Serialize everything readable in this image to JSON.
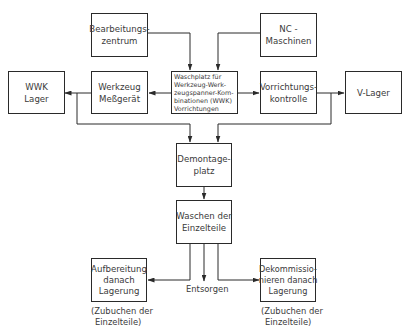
{
  "diagram": {
    "nodes": {
      "bearbeitungszentrum": {
        "lines": [
          "Bearbeitungs-",
          "zentrum"
        ]
      },
      "nc_maschinen": {
        "lines": [
          "NC  -",
          "Maschinen"
        ]
      },
      "wwk_lager": {
        "lines": [
          "WWK",
          "Lager"
        ]
      },
      "werkzeug_messgeraet": {
        "lines": [
          "Werkzeug",
          "Meßgerät"
        ]
      },
      "waschplatz": {
        "lines": [
          "Waschplatz  für",
          "Werkzeug-Werk-",
          "zeugspanner-Kom-",
          "binationen  (WWK)",
          "Vorrichtungen"
        ]
      },
      "vorrichtungskontrolle": {
        "lines": [
          "Vorrichtungs-",
          "kontrolle"
        ]
      },
      "v_lager": {
        "lines": [
          "V-Lager"
        ]
      },
      "demontageplatz": {
        "lines": [
          "Demontage-",
          "platz"
        ]
      },
      "waschen": {
        "lines": [
          "Waschen  der",
          "Einzelteile"
        ]
      },
      "aufbereitung": {
        "lines": [
          "Aufbereitung",
          "danach",
          "Lagerung"
        ]
      },
      "dekommissionieren": {
        "lines": [
          "Dekommissio-",
          "nieren  danach",
          "Lagerung"
        ]
      }
    },
    "labels": {
      "entsorgen": "Entsorgen",
      "note_left": [
        "(Zubuchen  der",
        "Einzelteile)"
      ],
      "note_right": [
        "(Zubuchen  der",
        "Einzelteile)"
      ]
    },
    "edges": [
      {
        "from": "Bearbeitungszentrum",
        "to": "Waschplatz"
      },
      {
        "from": "NC - Maschinen",
        "to": "Waschplatz"
      },
      {
        "from": "Waschplatz",
        "to": "Werkzeug Meßgerät"
      },
      {
        "from": "Werkzeug Meßgerät",
        "to": "WWK Lager"
      },
      {
        "from": "Waschplatz",
        "to": "Vorrichtungskontrolle"
      },
      {
        "from": "Vorrichtungskontrolle",
        "to": "V-Lager"
      },
      {
        "from": "Werkzeug Meßgerät branch",
        "to": "Demontageplatz"
      },
      {
        "from": "Vorrichtungskontrolle branch",
        "to": "Demontageplatz"
      },
      {
        "from": "Demontageplatz",
        "to": "Waschen der Einzelteile"
      },
      {
        "from": "Waschen der Einzelteile",
        "to": "Aufbereitung danach Lagerung"
      },
      {
        "from": "Waschen der Einzelteile",
        "to": "Entsorgen"
      },
      {
        "from": "Waschen der Einzelteile",
        "to": "Dekommissionieren danach Lagerung"
      }
    ],
    "colors": {
      "stroke": "#2a2a2a",
      "text": "#3a3a3a",
      "background": "#ffffff"
    }
  }
}
